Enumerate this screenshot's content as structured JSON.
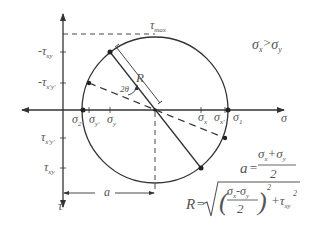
{
  "diagram": {
    "colors": {
      "line": "#333333",
      "text": "#555555",
      "background": "#ffffff"
    },
    "axes": {
      "horizontal": {
        "label": "σ"
      },
      "vertical": {
        "label": "τ"
      }
    },
    "top_label": {
      "base": "τ",
      "sub": "max"
    },
    "condition": {
      "left": "σ",
      "left_sub": "x",
      "op": ">",
      "right": "σ",
      "right_sub": "y"
    },
    "left_labels": [
      {
        "prefix": "-τ",
        "sub": "xy"
      },
      {
        "prefix": "-τ",
        "sub": "x'y'"
      },
      {
        "prefix": "τ",
        "sub": "x'y'"
      },
      {
        "prefix": "τ",
        "sub": "xy"
      }
    ],
    "sigma_labels": [
      {
        "base": "σ",
        "sub": "2"
      },
      {
        "base": "σ",
        "sub": "y'"
      },
      {
        "base": "σ",
        "sub": "y"
      },
      {
        "base": "σ",
        "sub": "x"
      },
      {
        "base": "σ",
        "sub": "x'"
      },
      {
        "base": "σ",
        "sub": "1"
      }
    ],
    "radius_label": "R",
    "angle_label": "2θ",
    "center_distance_label": "a",
    "formulas": {
      "a": {
        "lhs": "a",
        "eq": "=",
        "num_1": "σ",
        "num_1_sub": "x",
        "plus": "+",
        "num_2": "σ",
        "num_2_sub": "y",
        "den": "2"
      },
      "R": {
        "lhs": "R",
        "eq": "=",
        "num_1": "σ",
        "num_1_sub": "x",
        "minus": "-",
        "num_2": "σ",
        "num_2_sub": "y",
        "den": "2",
        "pow": "2",
        "plus": "+τ",
        "tau_sub": "xy",
        "tau_pow": "2"
      }
    }
  }
}
